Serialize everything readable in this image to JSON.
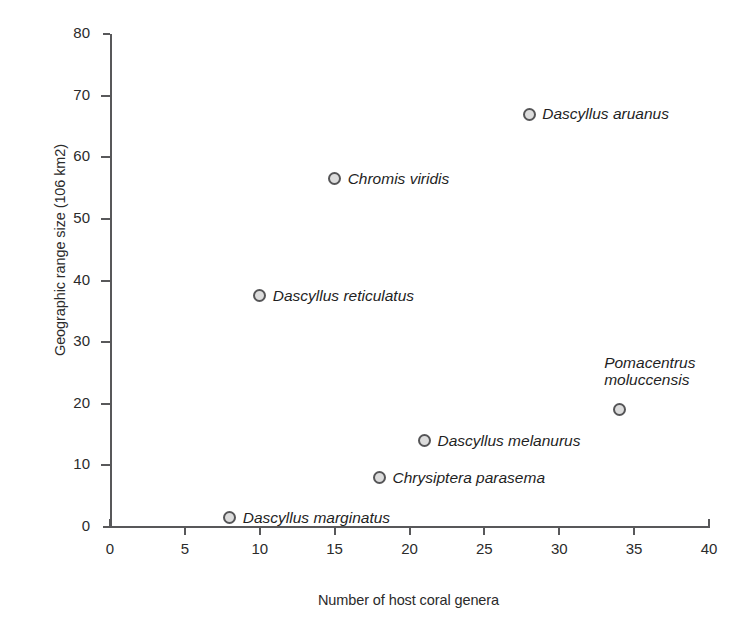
{
  "chart_data": {
    "type": "scatter",
    "title": "",
    "xlabel": "Number of host coral genera",
    "ylabel": "Geographic range size (106 km2)",
    "xlim": [
      0,
      40
    ],
    "ylim": [
      0,
      80
    ],
    "xticks": [
      "0",
      "5",
      "10",
      "15",
      "20",
      "25",
      "30",
      "35",
      "40"
    ],
    "yticks": [
      "0",
      "10",
      "20",
      "30",
      "40",
      "50",
      "60",
      "70",
      "80"
    ],
    "grid": false,
    "legend": "none",
    "marker_fill": "#dcdcdc",
    "marker_edge": "#555557",
    "axis_color": "#58585a",
    "points": [
      {
        "label": "Dascyllus aruanus",
        "x": 28,
        "y": 67.0,
        "label_pos": "right"
      },
      {
        "label": "Chromis viridis",
        "x": 15,
        "y": 56.5,
        "label_pos": "right"
      },
      {
        "label": "Dascyllus reticulatus",
        "x": 10,
        "y": 37.5,
        "label_pos": "right"
      },
      {
        "label": "Pomacentrus moluccensis",
        "x": 34,
        "y": 19.0,
        "label_pos": "above"
      },
      {
        "label": "Dascyllus melanurus",
        "x": 21,
        "y": 14.0,
        "label_pos": "right"
      },
      {
        "label": "Chrysiptera parasema",
        "x": 18,
        "y": 8.0,
        "label_pos": "right"
      },
      {
        "label": "Dascyllus marginatus",
        "x": 8,
        "y": 1.5,
        "label_pos": "right"
      }
    ]
  }
}
